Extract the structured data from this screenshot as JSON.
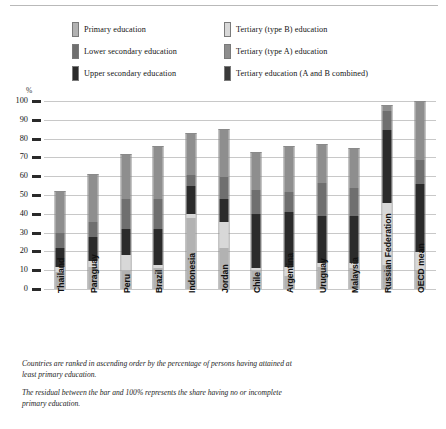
{
  "legend": {
    "items": [
      {
        "label": "Primary education",
        "color": "#b2b2b2",
        "key": "primary",
        "col": 0
      },
      {
        "label": "Tertiary (type B) education",
        "color": "#d8d8d8",
        "key": "tertiary_b",
        "col": 1
      },
      {
        "label": "Lower secondary education",
        "color": "#6f6f6f",
        "key": "lower_secondary",
        "col": 0
      },
      {
        "label": "Tertiary (type A) education",
        "color": "#8e8e8e",
        "key": "tertiary_a",
        "col": 1
      },
      {
        "label": "Upper secondary education",
        "color": "#2b2b2b",
        "key": "upper_secondary",
        "col": 0
      },
      {
        "label": "Tertiary education (A and B combined)",
        "color": "#3a3a3a",
        "key": "tertiary_ab",
        "col": 1
      }
    ]
  },
  "axis": {
    "unit": "%",
    "ticks": [
      "100",
      "90",
      "80",
      "70",
      "60",
      "50",
      "40",
      "30",
      "20",
      "10",
      "0"
    ]
  },
  "notes": [
    "Countries are ranked in ascending order by the percentage of persons having attained at least primary education.",
    "The residual between the bar and 100% represents the share having no or incomplete primary education."
  ],
  "chart_data": {
    "type": "bar",
    "stacked": true,
    "title": "",
    "xlabel": "",
    "ylabel": "%",
    "ylim": [
      0,
      100
    ],
    "grid": true,
    "legend_position": "top",
    "categories": [
      "Thailand",
      "Paraguay",
      "Peru",
      "Brazil",
      "Indonesia",
      "Jordan",
      "Chile",
      "Argentina",
      "Uruguay",
      "Malaysia",
      "Russian Federation",
      "OECD mean"
    ],
    "series": [
      {
        "name": "Primary education",
        "color": "#b2b2b2",
        "values": [
          9,
          12,
          10,
          11,
          38,
          22,
          10,
          7,
          12,
          11,
          13,
          10
        ]
      },
      {
        "name": "Tertiary (type B) education",
        "color": "#d8d8d8",
        "values": [
          3,
          3,
          8,
          2,
          2,
          14,
          1,
          5,
          2,
          3,
          33,
          10
        ]
      },
      {
        "name": "Upper secondary education",
        "color": "#2b2b2b",
        "values": [
          10,
          13,
          14,
          19,
          15,
          12,
          29,
          29,
          25,
          25,
          39,
          36
        ]
      },
      {
        "name": "Lower secondary education",
        "color": "#6f6f6f",
        "values": [
          8,
          8,
          16,
          16,
          6,
          12,
          13,
          11,
          18,
          15,
          10,
          13
        ]
      },
      {
        "name": "Tertiary (type A) education",
        "color": "#8e8e8e",
        "values": [
          22,
          25,
          24,
          28,
          22,
          25,
          20,
          24,
          20,
          21,
          3,
          31
        ]
      }
    ],
    "totals": [
      52,
      61,
      72,
      76,
      83,
      85,
      73,
      76,
      77,
      75,
      98,
      100
    ]
  },
  "bars": [
    {
      "name": "Thailand",
      "segments": [
        {
          "k": "primary",
          "v": 9
        },
        {
          "k": "tertiary_b",
          "v": 3
        },
        {
          "k": "upper_secondary",
          "v": 10
        },
        {
          "k": "lower_secondary",
          "v": 8
        },
        {
          "k": "tertiary_a",
          "v": 22
        }
      ]
    },
    {
      "name": "Paraguay",
      "segments": [
        {
          "k": "primary",
          "v": 12
        },
        {
          "k": "tertiary_b",
          "v": 3
        },
        {
          "k": "upper_secondary",
          "v": 13
        },
        {
          "k": "lower_secondary",
          "v": 8
        },
        {
          "k": "tertiary_a",
          "v": 25
        }
      ]
    },
    {
      "name": "Peru",
      "segments": [
        {
          "k": "primary",
          "v": 10
        },
        {
          "k": "tertiary_b",
          "v": 8
        },
        {
          "k": "upper_secondary",
          "v": 14
        },
        {
          "k": "lower_secondary",
          "v": 16
        },
        {
          "k": "tertiary_a",
          "v": 24
        }
      ]
    },
    {
      "name": "Brazil",
      "segments": [
        {
          "k": "primary",
          "v": 11
        },
        {
          "k": "tertiary_b",
          "v": 2
        },
        {
          "k": "upper_secondary",
          "v": 19
        },
        {
          "k": "lower_secondary",
          "v": 16
        },
        {
          "k": "tertiary_a",
          "v": 28
        }
      ]
    },
    {
      "name": "Indonesia",
      "segments": [
        {
          "k": "primary",
          "v": 38
        },
        {
          "k": "tertiary_b",
          "v": 2
        },
        {
          "k": "upper_secondary",
          "v": 15
        },
        {
          "k": "lower_secondary",
          "v": 6
        },
        {
          "k": "tertiary_a",
          "v": 22
        }
      ]
    },
    {
      "name": "Jordan",
      "segments": [
        {
          "k": "primary",
          "v": 22
        },
        {
          "k": "tertiary_b",
          "v": 14
        },
        {
          "k": "upper_secondary",
          "v": 12
        },
        {
          "k": "lower_secondary",
          "v": 12
        },
        {
          "k": "tertiary_a",
          "v": 25
        }
      ]
    },
    {
      "name": "Chile",
      "segments": [
        {
          "k": "primary",
          "v": 10
        },
        {
          "k": "tertiary_b",
          "v": 1
        },
        {
          "k": "upper_secondary",
          "v": 29
        },
        {
          "k": "lower_secondary",
          "v": 13
        },
        {
          "k": "tertiary_a",
          "v": 20
        }
      ]
    },
    {
      "name": "Argentina",
      "segments": [
        {
          "k": "primary",
          "v": 7
        },
        {
          "k": "tertiary_b",
          "v": 5
        },
        {
          "k": "upper_secondary",
          "v": 29
        },
        {
          "k": "lower_secondary",
          "v": 11
        },
        {
          "k": "tertiary_a",
          "v": 24
        }
      ]
    },
    {
      "name": "Uruguay",
      "segments": [
        {
          "k": "primary",
          "v": 12
        },
        {
          "k": "tertiary_b",
          "v": 2
        },
        {
          "k": "upper_secondary",
          "v": 25
        },
        {
          "k": "lower_secondary",
          "v": 18
        },
        {
          "k": "tertiary_a",
          "v": 20
        }
      ]
    },
    {
      "name": "Malaysia",
      "segments": [
        {
          "k": "primary",
          "v": 11
        },
        {
          "k": "tertiary_b",
          "v": 3
        },
        {
          "k": "upper_secondary",
          "v": 25
        },
        {
          "k": "lower_secondary",
          "v": 15
        },
        {
          "k": "tertiary_a",
          "v": 21
        }
      ]
    },
    {
      "name": "Russian Federation",
      "segments": [
        {
          "k": "primary",
          "v": 13
        },
        {
          "k": "tertiary_b",
          "v": 33
        },
        {
          "k": "upper_secondary",
          "v": 39
        },
        {
          "k": "lower_secondary",
          "v": 10
        },
        {
          "k": "tertiary_a",
          "v": 3
        }
      ]
    },
    {
      "name": "OECD mean",
      "segments": [
        {
          "k": "primary",
          "v": 10
        },
        {
          "k": "tertiary_b",
          "v": 10
        },
        {
          "k": "upper_secondary",
          "v": 36
        },
        {
          "k": "lower_secondary",
          "v": 13
        },
        {
          "k": "tertiary_a",
          "v": 31
        }
      ]
    }
  ],
  "colors": {
    "primary": "#b2b2b2",
    "tertiary_b": "#d8d8d8",
    "upper_secondary": "#2b2b2b",
    "lower_secondary": "#6f6f6f",
    "tertiary_a": "#8e8e8e"
  }
}
